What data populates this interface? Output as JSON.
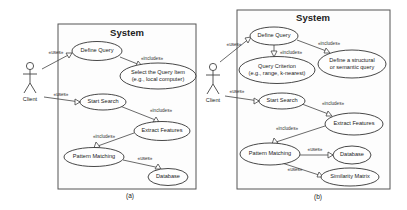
{
  "diagrams": [
    {
      "caption": "(a)",
      "system_title": "System",
      "actor": "Client",
      "use_cases": {
        "define_query": "Define Query",
        "select_item_1": "Select the Query Item",
        "select_item_2": "(e.g., local computer)",
        "start_search": "Start Search",
        "extract_features": "Extract Features",
        "pattern_matching": "Pattern Matching",
        "database": "Database"
      },
      "relations": {
        "client_define": "«uses»",
        "client_start": "«uses»",
        "define_select": "«includes»",
        "start_extract": "«includes»",
        "extract_pattern": "«includes»",
        "pattern_database": "«uses»"
      }
    },
    {
      "caption": "(b)",
      "system_title": "System",
      "actor": "Client",
      "use_cases": {
        "define_query": "Define Query",
        "criterion_1": "Query Criterion",
        "criterion_2": "(e.g., range, k-nearest)",
        "structural_1": "Define a structural",
        "structural_2": "or semantic query",
        "start_search": "Start Search",
        "extract_features": "Extract Features",
        "pattern_matching": "Pattern Matching",
        "database": "Database",
        "similarity_matrix": "Similarity Matrix"
      },
      "relations": {
        "client_define": "«uses»",
        "client_start": "«uses»",
        "define_criterion": "«includes»",
        "define_structural": "«includes»",
        "start_extract": "«includes»",
        "extract_pattern": "«includes»",
        "pattern_database": "«uses»",
        "pattern_similarity": "«uses»"
      }
    }
  ]
}
